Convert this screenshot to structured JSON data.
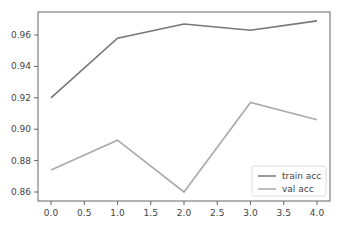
{
  "chart_data": {
    "type": "line",
    "title": "",
    "xlabel": "",
    "ylabel": "",
    "x": [
      0,
      1,
      2,
      3,
      4
    ],
    "series": [
      {
        "name": "train acc",
        "values": [
          0.92,
          0.958,
          0.967,
          0.963,
          0.969
        ],
        "color": "#777777"
      },
      {
        "name": "val acc",
        "values": [
          0.874,
          0.893,
          0.86,
          0.917,
          0.906
        ],
        "color": "#aaaaaa"
      }
    ],
    "xlim": [
      -0.2,
      4.2
    ],
    "ylim": [
      0.854,
      0.974
    ],
    "xticks": [
      "0.0",
      "0.5",
      "1.0",
      "1.5",
      "2.0",
      "2.5",
      "3.0",
      "3.5",
      "4.0"
    ],
    "yticks": [
      "0.86",
      "0.88",
      "0.90",
      "0.92",
      "0.94",
      "0.96"
    ],
    "grid": false,
    "legend_position": "lower right"
  }
}
